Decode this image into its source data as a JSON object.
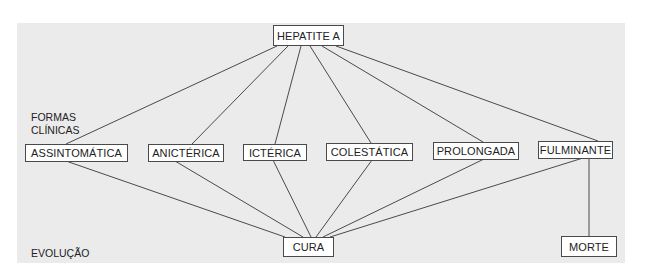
{
  "diagram": {
    "root": {
      "id": "hepatite",
      "label": "HEPATITE A"
    },
    "section_labels": {
      "formas_line1": "FORMAS",
      "formas_line2": "CLÍNICAS",
      "evolucao": "EVOLUÇÃO"
    },
    "forms": [
      {
        "id": "assintomatica",
        "label": "ASSINTOMÁTICA"
      },
      {
        "id": "anicterica",
        "label": "ANICTÉRICA"
      },
      {
        "id": "icterica",
        "label": "ICTÉRICA"
      },
      {
        "id": "colestatica",
        "label": "COLESTÁTICA"
      },
      {
        "id": "prolongada",
        "label": "PROLONGADA"
      },
      {
        "id": "fulminante",
        "label": "FULMINANTE"
      }
    ],
    "outcomes": [
      {
        "id": "cura",
        "label": "CURA"
      },
      {
        "id": "morte",
        "label": "MORTE"
      }
    ],
    "edges": [
      [
        "hepatite",
        "assintomatica"
      ],
      [
        "hepatite",
        "anicterica"
      ],
      [
        "hepatite",
        "icterica"
      ],
      [
        "hepatite",
        "colestatica"
      ],
      [
        "hepatite",
        "prolongada"
      ],
      [
        "hepatite",
        "fulminante"
      ],
      [
        "assintomatica",
        "cura"
      ],
      [
        "anicterica",
        "cura"
      ],
      [
        "icterica",
        "cura"
      ],
      [
        "colestatica",
        "cura"
      ],
      [
        "prolongada",
        "cura"
      ],
      [
        "fulminante",
        "cura"
      ],
      [
        "fulminante",
        "morte"
      ]
    ],
    "colors": {
      "background": "#ebebeb",
      "node_fill": "#ffffff",
      "stroke": "#4a4a4a"
    }
  }
}
